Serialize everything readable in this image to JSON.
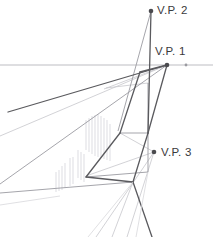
{
  "figure": {
    "title_text": "",
    "kind": "three-point-perspective-construction",
    "background_color": "#ffffff"
  },
  "labels": {
    "vp2": "V.P. 2",
    "vp1": "V.P. 1",
    "vp3": "V.P. 3"
  },
  "colors": {
    "label_text": "#3a3a3c",
    "heavy_line": "#555559",
    "medium_line": "#8a8a90",
    "light_line": "#b9b9bf",
    "faint_line": "#d2d2d6",
    "hatch_line": "#c9c9cf",
    "dot_fill": "#4a4a4e",
    "horizon_line": "#b0b0b6"
  },
  "vanishing_points": [
    {
      "name": "V.P. 2",
      "x": 151,
      "y": 11,
      "dot_radius": 2.3
    },
    {
      "name": "V.P. 1",
      "x": 167,
      "y": 65,
      "dot_radius": 2.3
    },
    {
      "name": "V.P. 3",
      "x": 154,
      "y": 152,
      "dot_radius": 2.3
    }
  ],
  "horizon": {
    "y": 65,
    "x_start": 0,
    "x_end": 213,
    "tick_dot_x": 186,
    "tick_dot_y": 65
  },
  "geometry_notes": {
    "near_vertical_edge_top_x": 140,
    "near_vertical_edge_bottom_x": 148,
    "box_bottom_y": 133,
    "lower_convergence_x": 133,
    "lower_convergence_y": 182,
    "hatch_region": {
      "x_start": 84,
      "x_end": 112,
      "y_top": 113,
      "y_bottom": 192
    }
  }
}
